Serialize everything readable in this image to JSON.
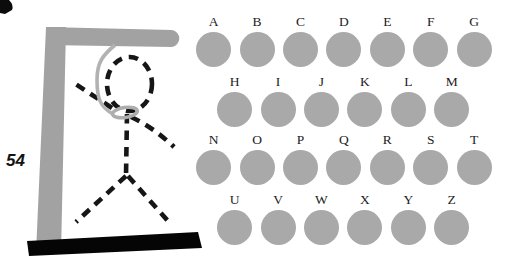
{
  "hangman_panel": {
    "counter": "54",
    "colors": {
      "gallows_gray": "#a2a2a2",
      "rope_gray": "#b2b2b2",
      "noose_gray": "#adadad",
      "figure_black": "#161616",
      "base_black": "#050505",
      "counter_black": "#141414"
    }
  },
  "letter_board": {
    "circle_color": "#a9a9a9",
    "rows": [
      {
        "letters": [
          "A",
          "B",
          "C",
          "D",
          "E",
          "F",
          "G"
        ]
      },
      {
        "letters": [
          "H",
          "I",
          "J",
          "K",
          "L",
          "M"
        ]
      },
      {
        "letters": [
          "N",
          "O",
          "P",
          "Q",
          "R",
          "S",
          "T"
        ]
      },
      {
        "letters": [
          "U",
          "V",
          "W",
          "X",
          "Y",
          "Z"
        ]
      }
    ]
  }
}
